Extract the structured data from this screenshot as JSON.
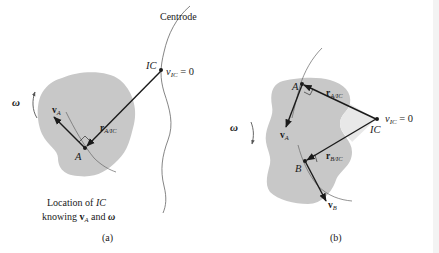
{
  "figure_a": {
    "centrode_label": "Centrode",
    "ic_label": "IC",
    "v_ic_label": "v",
    "v_ic_sub": "IC",
    "v_ic_eq": " = 0",
    "v_label": "v",
    "v_sub": "A",
    "r_label": "r",
    "r_sub": "A/IC",
    "point_label": "A",
    "omega_label": "ω",
    "caption_line1_pre": "Location of ",
    "caption_line1_ital": "IC",
    "caption_line2_pre": "knowing ",
    "caption_line2_v": "v",
    "caption_line2_sub": "A",
    "caption_line2_mid": " and ",
    "caption_line2_omega": "ω",
    "panel_label": "(a)"
  },
  "figure_b": {
    "point_a_label": "A",
    "point_b_label": "B",
    "ic_label": "IC",
    "v_ic_label": "v",
    "v_ic_sub": "IC",
    "v_ic_eq": " = 0",
    "ra_label": "r",
    "ra_sub": "A/IC",
    "rb_label": "r",
    "rb_sub": "B/IC",
    "va_label": "v",
    "va_sub": "A",
    "vb_label": "v",
    "vb_sub": "B",
    "omega_label": "ω",
    "panel_label": "(b)"
  },
  "colors": {
    "body_fill": "#c8c8c8",
    "ink": "#1a1a1a",
    "light_region": "#e8e8e8"
  }
}
